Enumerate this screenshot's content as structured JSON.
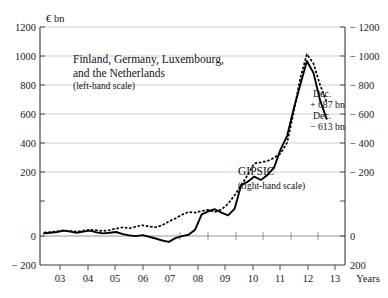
{
  "chart_data": {
    "type": "line",
    "title": "",
    "subtitle": "",
    "xlabel": "Years",
    "ylabel": "€ bn",
    "unit_label": "€ bn",
    "grid": true,
    "legend_position": "inline-annotation",
    "x": [
      2002.75,
      2003.0,
      2003.25,
      2003.5,
      2003.75,
      2004.0,
      2004.25,
      2004.5,
      2004.75,
      2005.0,
      2005.25,
      2005.5,
      2005.75,
      2006.0,
      2006.25,
      2006.5,
      2006.75,
      2007.0,
      2007.25,
      2007.5,
      2007.75,
      2008.0,
      2008.25,
      2008.5,
      2008.75,
      2009.0,
      2009.25,
      2009.5,
      2009.75,
      2010.0,
      2010.25,
      2010.5,
      2010.75,
      2011.0,
      2011.25,
      2011.5,
      2011.75,
      2012.0,
      2012.25,
      2012.5,
      2012.75,
      2013.0,
      2013.25,
      2013.5
    ],
    "xlim": [
      2002.6,
      2014.2
    ],
    "ylim_left": [
      -200,
      1200
    ],
    "ylim_right": [
      200,
      -1200
    ],
    "yticks_left": [
      -200,
      0,
      200,
      400,
      600,
      800,
      1000,
      1200
    ],
    "yticks_right": [
      200,
      0,
      -200,
      -400,
      -600,
      -800,
      -1000,
      -1200
    ],
    "ytick_labels_left": [
      "− 200",
      "0",
      "200",
      "400",
      "600",
      "800",
      "1000",
      "1200"
    ],
    "ytick_labels_right": [
      "200",
      "0",
      "− 200",
      "− 400",
      "− 600",
      "− 800",
      "− 1000",
      "− 1200"
    ],
    "xticks": [
      2003,
      2004,
      2005,
      2006,
      2007,
      2008,
      2009,
      2010,
      2011,
      2012,
      2013
    ],
    "xtick_labels": [
      "03",
      "04",
      "05",
      "06",
      "07",
      "08",
      "09",
      "10",
      "11",
      "12",
      "13"
    ],
    "note_right_axis": "Right-hand scale is inverted (negative downward); GIPSIC balances are negative.",
    "series": [
      {
        "name": "Finland, Germany, Luxembourg, and the Netherlands",
        "label_lines": [
          "Finland, Germany, Luxembourg,",
          "and the Netherlands"
        ],
        "scale_note": "(left-hand scale)",
        "style": "dotted",
        "axis": "left",
        "end_annotation": [
          "Dec.",
          "+ 687 bn"
        ],
        "end_value": 687,
        "peak_value": 1060,
        "peak_x": 2012.17,
        "values": [
          -10,
          -6,
          -2,
          4,
          0,
          -4,
          2,
          8,
          4,
          0,
          6,
          14,
          22,
          16,
          26,
          34,
          26,
          22,
          34,
          56,
          74,
          96,
          112,
          108,
          118,
          124,
          112,
          126,
          160,
          210,
          268,
          330,
          398,
          404,
          412,
          430,
          456,
          520,
          700,
          900,
          1040,
          985,
          860,
          760
        ]
      },
      {
        "name": "GIPSIC",
        "label_lines": [
          "GIPSIC"
        ],
        "scale_note": "(right-hand scale)",
        "style": "solid",
        "axis": "right",
        "end_annotation": [
          "Dec.",
          "− 613 bn"
        ],
        "end_value": -613,
        "peak_value": -1000,
        "peak_x": 2012.2,
        "values": [
          -14,
          -10,
          -6,
          2,
          -4,
          -10,
          -4,
          2,
          -8,
          -14,
          -10,
          -6,
          -18,
          -26,
          -30,
          -24,
          -34,
          -44,
          -56,
          -64,
          -42,
          -30,
          -22,
          8,
          98,
          116,
          128,
          108,
          92,
          130,
          270,
          290,
          320,
          300,
          330,
          372,
          480,
          560,
          720,
          860,
          1000,
          930,
          770,
          660
        ]
      }
    ],
    "annotations": [
      {
        "id": "north-end",
        "lines": [
          "Dec.",
          "+ 687 bn"
        ],
        "x_px": 313,
        "y_px": 96
      },
      {
        "id": "gipsic-end",
        "lines": [
          "Dec.",
          "− 613 bn"
        ],
        "x_px": 313,
        "y_px": 119
      }
    ]
  },
  "axes": {
    "unit_top_left": "€ bn",
    "x_axis_title": "Years"
  },
  "labels": {
    "north_block_line1": "Finland, Germany, Luxembourg,",
    "north_block_line2": "and the Netherlands",
    "north_block_scale": "(left-hand scale)",
    "gipsic_name": "GIPSIC",
    "gipsic_scale": "(right-hand scale)",
    "annot_north_head": "Dec.",
    "annot_north_value": "+ 687 bn",
    "annot_gipsic_head": "Dec.",
    "annot_gipsic_value": "− 613 bn"
  },
  "colors": {
    "background": "#ffffff",
    "line": "#000000",
    "grid": "#b9b9b9",
    "frame": "#3a3a3a",
    "text": "#111111"
  }
}
